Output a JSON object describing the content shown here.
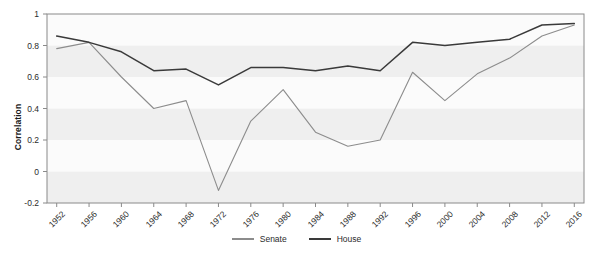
{
  "chart_data": {
    "type": "line",
    "title": "",
    "xlabel": "",
    "ylabel": "Correlation",
    "ylim": [
      -0.2,
      1
    ],
    "xlim": [
      1952,
      2016
    ],
    "grid": false,
    "banded_background": true,
    "legend_position": "bottom",
    "x": [
      1952,
      1956,
      1960,
      1964,
      1968,
      1972,
      1976,
      1980,
      1984,
      1988,
      1992,
      1996,
      2000,
      2004,
      2008,
      2012,
      2016
    ],
    "categories": [
      "1952",
      "1956",
      "1960",
      "1964",
      "1968",
      "1972",
      "1976",
      "1980",
      "1984",
      "1988",
      "1992",
      "1996",
      "2000",
      "2004",
      "2008",
      "2012",
      "2016"
    ],
    "yticks": [
      -0.2,
      0,
      0.2,
      0.4,
      0.6,
      0.8,
      1
    ],
    "ytick_labels": [
      "-0.2",
      "0",
      "0.2",
      "0.4",
      "0.6",
      "0.8",
      "1"
    ],
    "series": [
      {
        "name": "Senate",
        "color": "#8c8c8c",
        "values": [
          0.78,
          0.82,
          0.6,
          0.4,
          0.45,
          -0.12,
          0.32,
          0.52,
          0.25,
          0.16,
          0.2,
          0.63,
          0.45,
          0.62,
          0.72,
          0.86,
          0.93
        ]
      },
      {
        "name": "House",
        "color": "#3a3a3a",
        "values": [
          0.86,
          0.82,
          0.76,
          0.64,
          0.65,
          0.55,
          0.66,
          0.66,
          0.64,
          0.67,
          0.64,
          0.82,
          0.8,
          0.82,
          0.84,
          0.93,
          0.94
        ]
      }
    ]
  },
  "legend": {
    "items": [
      {
        "label": "Senate",
        "color": "#8c8c8c"
      },
      {
        "label": "House",
        "color": "#3a3a3a"
      }
    ]
  },
  "colors": {
    "plot_background": "#f7f7f7",
    "band_light": "#fbfbfb",
    "band_dark": "#efefef",
    "axis": "#8a8a8a",
    "text": "#2b2b2b"
  }
}
